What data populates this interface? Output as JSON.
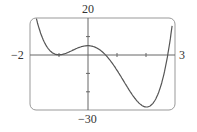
{
  "chart_data": {
    "type": "line",
    "title": "",
    "xlabel": "",
    "ylabel": "",
    "xlim": [
      -2,
      3
    ],
    "ylim": [
      -30,
      20
    ],
    "tick_labels": {
      "x_min": "−2",
      "x_max": "3",
      "y_max": "20",
      "y_min": "−30"
    },
    "series": [
      {
        "name": "f(x)",
        "x": [
          -1.9,
          -1.5,
          -1,
          -0.5,
          0,
          0.5,
          1,
          1.5,
          2,
          2.5,
          2.75,
          2.9
        ],
        "y": [
          19,
          4,
          0,
          2.6,
          5,
          1,
          -13.5,
          -25,
          -26.5,
          -15,
          -1,
          12
        ]
      }
    ],
    "grid": false
  },
  "labels": {
    "y_max": "20",
    "y_min": "−30",
    "x_min": "−2",
    "x_max": "3"
  }
}
